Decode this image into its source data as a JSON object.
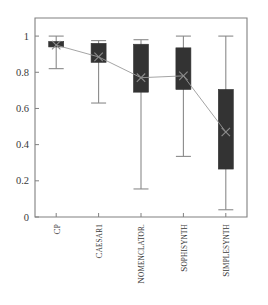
{
  "chart_data": {
    "type": "box",
    "title": "",
    "xlabel": "",
    "ylabel": "",
    "ylim": [
      0,
      1.1
    ],
    "grid": false,
    "legend": null,
    "categories": [
      "CP",
      "CAESAR1",
      "NOMENCLATOR.",
      "SOPHISYNTH",
      "SIMPLESYNTH"
    ],
    "ytick_labels": [
      "0",
      "0.2",
      "0.4",
      "0.6",
      "0.8",
      "1"
    ],
    "ytick_values": [
      0,
      0.2,
      0.4,
      0.6,
      0.8,
      1
    ],
    "boxes": [
      {
        "category": "CP",
        "whisker_low": 0.82,
        "q1": 0.94,
        "q3": 0.97,
        "whisker_high": 1.0,
        "mean": 0.95
      },
      {
        "category": "CAESAR1",
        "whisker_low": 0.63,
        "q1": 0.855,
        "q3": 0.96,
        "whisker_high": 0.975,
        "mean": 0.885
      },
      {
        "category": "NOMENCLATOR.",
        "whisker_low": 0.155,
        "q1": 0.69,
        "q3": 0.955,
        "whisker_high": 0.98,
        "mean": 0.77
      },
      {
        "category": "SOPHISYNTH",
        "whisker_low": 0.335,
        "q1": 0.705,
        "q3": 0.935,
        "whisker_high": 1.0,
        "mean": 0.78
      },
      {
        "category": "SIMPLESYNTH",
        "whisker_low": 0.04,
        "q1": 0.265,
        "q3": 0.705,
        "whisker_high": 1.0,
        "mean": 0.47
      }
    ],
    "mean_series": {
      "name": "mean",
      "values": [
        0.95,
        0.885,
        0.77,
        0.78,
        0.47
      ],
      "marker": "x",
      "connected": true
    },
    "colors": {
      "box_fill": "#333333",
      "whisker": "#8a8a8a",
      "axis": "#808080",
      "mean_line": "#9a9a9a",
      "text": "#3a3a3a",
      "background": "#ffffff"
    }
  }
}
